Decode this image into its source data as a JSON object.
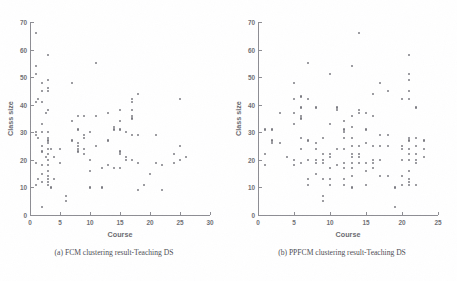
{
  "figure": {
    "background_color": "#ffffff",
    "ink_color": "#7b7b82",
    "panels": [
      {
        "id": "panel-a",
        "caption": "(a) FCM clustering result-Teaching DS",
        "xlabel": "Course",
        "ylabel": "Class size",
        "xlim": [
          0,
          30
        ],
        "ylim": [
          0,
          70
        ],
        "xticks": [
          0,
          5,
          10,
          15,
          20,
          25,
          30
        ],
        "yticks": [
          0,
          10,
          20,
          30,
          40,
          50,
          60,
          70
        ],
        "xticklabels": [
          "0",
          "5",
          "10",
          "15",
          "20",
          "25",
          "30"
        ],
        "yticklabels": [
          "0",
          "10",
          "20",
          "30",
          "40",
          "50",
          "60",
          "70"
        ]
      },
      {
        "id": "panel-b",
        "caption": "(b) PPFCM clustering result-Teaching DS",
        "xlabel": "Course",
        "ylabel": "Class size",
        "xlim": [
          0,
          25
        ],
        "ylim": [
          0,
          70
        ],
        "xticks": [
          0,
          5,
          10,
          15,
          20,
          25
        ],
        "yticks": [
          0,
          10,
          20,
          30,
          40,
          50,
          60,
          70
        ],
        "xticklabels": [
          "0",
          "5",
          "10",
          "15",
          "20",
          "25"
        ],
        "yticklabels": [
          "0",
          "10",
          "20",
          "30",
          "40",
          "50",
          "60",
          "70"
        ]
      }
    ]
  },
  "chart_data": [
    {
      "type": "scatter",
      "title": "(a) FCM clustering result-Teaching DS",
      "xlabel": "Course",
      "ylabel": "Class size",
      "xlim": [
        0,
        30
      ],
      "ylim": [
        0,
        70
      ],
      "grid": false,
      "legend": "none",
      "marker": "dot",
      "series": [
        {
          "name": "Teaching DS (FCM)",
          "points": [
            [
              1,
              66
            ],
            [
              1,
              54
            ],
            [
              1,
              51
            ],
            [
              1,
              41
            ],
            [
              1,
              30
            ],
            [
              1,
              29
            ],
            [
              1,
              19
            ],
            [
              1,
              11
            ],
            [
              1.3,
              42
            ],
            [
              1.3,
              28
            ],
            [
              1.3,
              13
            ],
            [
              2,
              48
            ],
            [
              2,
              45
            ],
            [
              2,
              41
            ],
            [
              2,
              33
            ],
            [
              2,
              30
            ],
            [
              2,
              25
            ],
            [
              2,
              23
            ],
            [
              2,
              18
            ],
            [
              2,
              15
            ],
            [
              2,
              12
            ],
            [
              2,
              3
            ],
            [
              2.6,
              37
            ],
            [
              2.6,
              21
            ],
            [
              3,
              58
            ],
            [
              3,
              49
            ],
            [
              3,
              46
            ],
            [
              3,
              45
            ],
            [
              3,
              38
            ],
            [
              3,
              30
            ],
            [
              3,
              28
            ],
            [
              3,
              27
            ],
            [
              3,
              26
            ],
            [
              3,
              24
            ],
            [
              3,
              22
            ],
            [
              3,
              20
            ],
            [
              3,
              18
            ],
            [
              3,
              16
            ],
            [
              3,
              14
            ],
            [
              3,
              13
            ],
            [
              3,
              12
            ],
            [
              3,
              11
            ],
            [
              3.5,
              24
            ],
            [
              3.5,
              10
            ],
            [
              4,
              21
            ],
            [
              4,
              13
            ],
            [
              5,
              24
            ],
            [
              5,
              19
            ],
            [
              6,
              7
            ],
            [
              6,
              5
            ],
            [
              7,
              48
            ],
            [
              7,
              34
            ],
            [
              7,
              27
            ],
            [
              8,
              36
            ],
            [
              8,
              31
            ],
            [
              8,
              26
            ],
            [
              8,
              25
            ],
            [
              8,
              24
            ],
            [
              8,
              23
            ],
            [
              9,
              36
            ],
            [
              9,
              29
            ],
            [
              9,
              28
            ],
            [
              9,
              24
            ],
            [
              9,
              22
            ],
            [
              10,
              30
            ],
            [
              10,
              20
            ],
            [
              10,
              16
            ],
            [
              10,
              10
            ],
            [
              11,
              55
            ],
            [
              11,
              36
            ],
            [
              11,
              25
            ],
            [
              12,
              17
            ],
            [
              12,
              10
            ],
            [
              13,
              37
            ],
            [
              13,
              27
            ],
            [
              13,
              18
            ],
            [
              14,
              32
            ],
            [
              14,
              31
            ],
            [
              14,
              17
            ],
            [
              15,
              38
            ],
            [
              15,
              34
            ],
            [
              15,
              31
            ],
            [
              15,
              23
            ],
            [
              15,
              22
            ],
            [
              15,
              17
            ],
            [
              16,
              30
            ],
            [
              16,
              21
            ],
            [
              16,
              20
            ],
            [
              17,
              42
            ],
            [
              17,
              41
            ],
            [
              17,
              38
            ],
            [
              17,
              36
            ],
            [
              17,
              35
            ],
            [
              17,
              29
            ],
            [
              17,
              20
            ],
            [
              18,
              44
            ],
            [
              18,
              29
            ],
            [
              18,
              19
            ],
            [
              18,
              9
            ],
            [
              19,
              11
            ],
            [
              20,
              15
            ],
            [
              21,
              29
            ],
            [
              21,
              19
            ],
            [
              22,
              18
            ],
            [
              22,
              9
            ],
            [
              24,
              22
            ],
            [
              24,
              19
            ],
            [
              25,
              42
            ],
            [
              25,
              25
            ],
            [
              25,
              20
            ],
            [
              26,
              21
            ]
          ]
        }
      ]
    },
    {
      "type": "scatter",
      "title": "(b) PPFCM clustering result-Teaching DS",
      "xlabel": "Course",
      "ylabel": "Class size",
      "xlim": [
        0,
        25
      ],
      "ylim": [
        0,
        70
      ],
      "grid": false,
      "legend": "none",
      "marker": "dot",
      "series": [
        {
          "name": "Teaching DS (PPFCM)",
          "points": [
            [
              1,
              31
            ],
            [
              1,
              22
            ],
            [
              1,
              18
            ],
            [
              2,
              31
            ],
            [
              2,
              27
            ],
            [
              2,
              26
            ],
            [
              3,
              37
            ],
            [
              3,
              26
            ],
            [
              4,
              21
            ],
            [
              5,
              48
            ],
            [
              5,
              42
            ],
            [
              5,
              37
            ],
            [
              5,
              33
            ],
            [
              5,
              20
            ],
            [
              5,
              18
            ],
            [
              6,
              43
            ],
            [
              6,
              39
            ],
            [
              6,
              36
            ],
            [
              6,
              35
            ],
            [
              6,
              28
            ],
            [
              6,
              24
            ],
            [
              6,
              19
            ],
            [
              7,
              55
            ],
            [
              7,
              42
            ],
            [
              7,
              27
            ],
            [
              7,
              20
            ],
            [
              7,
              13
            ],
            [
              7,
              11
            ],
            [
              8,
              39
            ],
            [
              8,
              26
            ],
            [
              8,
              24
            ],
            [
              8,
              20
            ],
            [
              8,
              19
            ],
            [
              8,
              15
            ],
            [
              9,
              28
            ],
            [
              9,
              22
            ],
            [
              9,
              20
            ],
            [
              9,
              19
            ],
            [
              9,
              13
            ],
            [
              9,
              7
            ],
            [
              9,
              5
            ],
            [
              10,
              51
            ],
            [
              10,
              33
            ],
            [
              10,
              22
            ],
            [
              10,
              21
            ],
            [
              10,
              17
            ],
            [
              10,
              13
            ],
            [
              10,
              11
            ],
            [
              11,
              39
            ],
            [
              11,
              38
            ],
            [
              11,
              24
            ],
            [
              11,
              18
            ],
            [
              12,
              34
            ],
            [
              12,
              31
            ],
            [
              12,
              30
            ],
            [
              12,
              28
            ],
            [
              12,
              24
            ],
            [
              12,
              19
            ],
            [
              12,
              17
            ],
            [
              12,
              13
            ],
            [
              12,
              11
            ],
            [
              13,
              54
            ],
            [
              13,
              36
            ],
            [
              13,
              32
            ],
            [
              13,
              28
            ],
            [
              13,
              25
            ],
            [
              13,
              22
            ],
            [
              13,
              21
            ],
            [
              13,
              19
            ],
            [
              13,
              17
            ],
            [
              13,
              14
            ],
            [
              13,
              10
            ],
            [
              14,
              66
            ],
            [
              14,
              38
            ],
            [
              14,
              37
            ],
            [
              14,
              25
            ],
            [
              14,
              22
            ],
            [
              14,
              21
            ],
            [
              14,
              19
            ],
            [
              15,
              37
            ],
            [
              15,
              31
            ],
            [
              15,
              26
            ],
            [
              15,
              19
            ],
            [
              15,
              16
            ],
            [
              15,
              11
            ],
            [
              16,
              44
            ],
            [
              16,
              36
            ],
            [
              16,
              25
            ],
            [
              16,
              20
            ],
            [
              16,
              19
            ],
            [
              16,
              17
            ],
            [
              17,
              48
            ],
            [
              17,
              29
            ],
            [
              17,
              25
            ],
            [
              17,
              20
            ],
            [
              17,
              14
            ],
            [
              18,
              45
            ],
            [
              18,
              29
            ],
            [
              18,
              25
            ],
            [
              18,
              14
            ],
            [
              19,
              10
            ],
            [
              19,
              3
            ],
            [
              20,
              42
            ],
            [
              20,
              25
            ],
            [
              20,
              24
            ],
            [
              20,
              20
            ],
            [
              20,
              14
            ],
            [
              20,
              11
            ],
            [
              21,
              58
            ],
            [
              21,
              51
            ],
            [
              21,
              49
            ],
            [
              21,
              45
            ],
            [
              21,
              42
            ],
            [
              21,
              28
            ],
            [
              21,
              27
            ],
            [
              21,
              24
            ],
            [
              21,
              22
            ],
            [
              21,
              20
            ],
            [
              21,
              16
            ],
            [
              21,
              13
            ],
            [
              21,
              12
            ],
            [
              21,
              11
            ],
            [
              22,
              39
            ],
            [
              22,
              28
            ],
            [
              22,
              25
            ],
            [
              22,
              22
            ],
            [
              22,
              20
            ],
            [
              22,
              19
            ],
            [
              22,
              11
            ],
            [
              23,
              27
            ],
            [
              23,
              24
            ],
            [
              23,
              21
            ]
          ]
        }
      ]
    }
  ]
}
